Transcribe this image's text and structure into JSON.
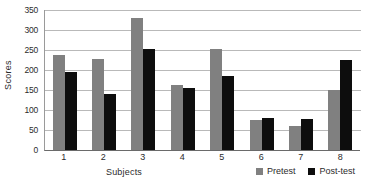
{
  "chart_data": {
    "type": "bar",
    "title": "",
    "xlabel": "Subjects",
    "ylabel": "Scores",
    "categories": [
      "1",
      "2",
      "3",
      "4",
      "5",
      "6",
      "7",
      "8"
    ],
    "ylim": [
      0,
      350
    ],
    "yticks": [
      0,
      50,
      100,
      150,
      200,
      250,
      300,
      350
    ],
    "ytick_labels": [
      "0",
      "50",
      "100",
      "150",
      "200",
      "250",
      "300",
      "350"
    ],
    "grid": true,
    "legend_position": "bottom-right",
    "series": [
      {
        "name": "Pretest",
        "color": "#808080",
        "values": [
          237,
          228,
          330,
          163,
          253,
          76,
          59,
          151
        ]
      },
      {
        "name": "Post-test",
        "color": "#0d0d0d",
        "values": [
          194,
          141,
          252,
          156,
          185,
          81,
          77,
          226
        ]
      }
    ]
  }
}
